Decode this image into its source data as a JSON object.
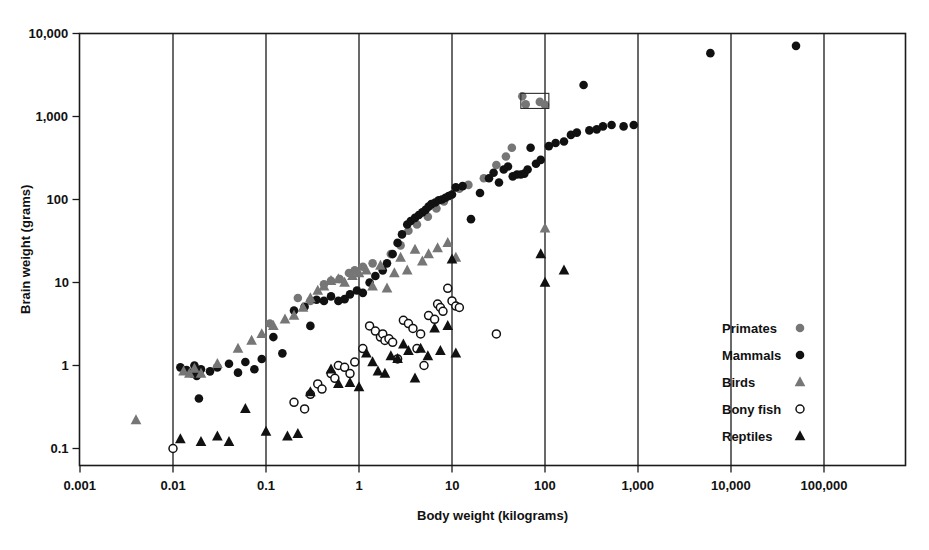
{
  "chart_data": {
    "type": "scatter",
    "title": "",
    "xlabel": "Body weight (kilograms)",
    "ylabel": "Brain weight (grams)",
    "xscale": "log",
    "yscale": "log",
    "xlim": [
      0.001,
      1000000
    ],
    "ylim": [
      0.07,
      10000
    ],
    "xticks": [
      0.001,
      0.01,
      0.1,
      1,
      10,
      100,
      1000,
      10000,
      100000
    ],
    "xticklabels": [
      "0.001",
      "0.01",
      "0.1",
      "1",
      "10",
      "100",
      "1,000",
      "10,000",
      "100,000"
    ],
    "yticks": [
      0.1,
      1,
      10,
      100,
      1000,
      10000
    ],
    "yticklabels": [
      "0.1",
      "1",
      "10",
      "100",
      "1,000",
      "10,000"
    ],
    "grid": "vertical-decade-lines",
    "legend_position": "inside-lower-right",
    "annotations": [
      {
        "kind": "box",
        "label": "",
        "x0": 55,
        "x1": 110,
        "y0": 1250,
        "y1": 1900
      }
    ],
    "series": [
      {
        "name": "Primates",
        "marker": "filled-circle",
        "color": "#767676",
        "points": [
          [
            0.11,
            3.2
          ],
          [
            0.22,
            6.5
          ],
          [
            0.3,
            6.0
          ],
          [
            0.42,
            9.5
          ],
          [
            0.5,
            10.5
          ],
          [
            0.62,
            11.0
          ],
          [
            0.78,
            13.0
          ],
          [
            0.9,
            14.0
          ],
          [
            1.1,
            15.5
          ],
          [
            1.4,
            17.0
          ],
          [
            2.2,
            22.0
          ],
          [
            2.8,
            28.0
          ],
          [
            3.4,
            42.0
          ],
          [
            4.2,
            50.0
          ],
          [
            5.5,
            62.0
          ],
          [
            6.8,
            78.0
          ],
          [
            8.2,
            95.0
          ],
          [
            9.5,
            110.0
          ],
          [
            12.0,
            135.0
          ],
          [
            15.0,
            150.0
          ],
          [
            22.0,
            180.0
          ],
          [
            30.0,
            260.0
          ],
          [
            38.0,
            330.0
          ],
          [
            44.0,
            420.0
          ],
          [
            57.0,
            1750.0
          ],
          [
            62.0,
            1400.0
          ],
          [
            88.0,
            1500.0
          ],
          [
            100.0,
            1380.0
          ]
        ]
      },
      {
        "name": "Mammals",
        "marker": "filled-circle",
        "color": "#111111",
        "points": [
          [
            0.012,
            0.95
          ],
          [
            0.014,
            0.88
          ],
          [
            0.016,
            0.8
          ],
          [
            0.017,
            1.0
          ],
          [
            0.018,
            0.75
          ],
          [
            0.019,
            0.4
          ],
          [
            0.02,
            0.9
          ],
          [
            0.025,
            0.85
          ],
          [
            0.03,
            0.95
          ],
          [
            0.04,
            1.05
          ],
          [
            0.05,
            0.82
          ],
          [
            0.06,
            1.1
          ],
          [
            0.075,
            0.9
          ],
          [
            0.09,
            1.2
          ],
          [
            0.12,
            2.2
          ],
          [
            0.15,
            1.4
          ],
          [
            0.2,
            4.6
          ],
          [
            0.26,
            5.1
          ],
          [
            0.3,
            3.0
          ],
          [
            0.35,
            6.2
          ],
          [
            0.42,
            6.0
          ],
          [
            0.5,
            6.8
          ],
          [
            0.6,
            6.0
          ],
          [
            0.7,
            6.3
          ],
          [
            0.8,
            7.2
          ],
          [
            0.95,
            8.0
          ],
          [
            1.1,
            7.5
          ],
          [
            1.3,
            10.0
          ],
          [
            1.5,
            12.0
          ],
          [
            1.8,
            14.0
          ],
          [
            2.0,
            17.0
          ],
          [
            2.3,
            22.0
          ],
          [
            2.6,
            30.0
          ],
          [
            2.9,
            38.0
          ],
          [
            3.3,
            50.0
          ],
          [
            3.6,
            55.0
          ],
          [
            4.0,
            60.0
          ],
          [
            4.4,
            65.0
          ],
          [
            4.8,
            70.0
          ],
          [
            5.2,
            75.0
          ],
          [
            5.6,
            82.0
          ],
          [
            6.0,
            88.0
          ],
          [
            6.6,
            92.0
          ],
          [
            7.2,
            98.0
          ],
          [
            7.8,
            100.0
          ],
          [
            8.5,
            105.0
          ],
          [
            9.2,
            110.0
          ],
          [
            10.0,
            115.0
          ],
          [
            11.0,
            140.0
          ],
          [
            13.0,
            145.0
          ],
          [
            16.0,
            58.0
          ],
          [
            20.0,
            120.0
          ],
          [
            25.0,
            180.0
          ],
          [
            28.0,
            210.0
          ],
          [
            32.0,
            160.0
          ],
          [
            36.0,
            230.0
          ],
          [
            40.0,
            250.0
          ],
          [
            45.0,
            190.0
          ],
          [
            50.0,
            200.0
          ],
          [
            55.0,
            200.0
          ],
          [
            60.0,
            205.0
          ],
          [
            65.0,
            230.0
          ],
          [
            70.0,
            420.0
          ],
          [
            80.0,
            270.0
          ],
          [
            90.0,
            300.0
          ],
          [
            110.0,
            440.0
          ],
          [
            130.0,
            480.0
          ],
          [
            160.0,
            500.0
          ],
          [
            190.0,
            600.0
          ],
          [
            220.0,
            640.0
          ],
          [
            260.0,
            2400.0
          ],
          [
            300.0,
            680.0
          ],
          [
            360.0,
            700.0
          ],
          [
            420.0,
            760.0
          ],
          [
            520.0,
            790.0
          ],
          [
            700.0,
            760.0
          ],
          [
            900.0,
            790.0
          ],
          [
            6000.0,
            5800.0
          ],
          [
            50000.0,
            7100.0
          ]
        ]
      },
      {
        "name": "Birds",
        "marker": "filled-triangle",
        "color": "#767676",
        "points": [
          [
            0.004,
            0.22
          ],
          [
            0.013,
            0.85
          ],
          [
            0.015,
            0.8
          ],
          [
            0.017,
            0.92
          ],
          [
            0.02,
            0.8
          ],
          [
            0.03,
            1.05
          ],
          [
            0.05,
            1.6
          ],
          [
            0.07,
            2.0
          ],
          [
            0.09,
            2.4
          ],
          [
            0.12,
            3.0
          ],
          [
            0.16,
            3.6
          ],
          [
            0.2,
            4.0
          ],
          [
            0.25,
            5.0
          ],
          [
            0.3,
            6.5
          ],
          [
            0.36,
            8.0
          ],
          [
            0.42,
            9.0
          ],
          [
            0.5,
            10.5
          ],
          [
            0.6,
            11.0
          ],
          [
            0.7,
            10.0
          ],
          [
            0.85,
            12.0
          ],
          [
            1.0,
            13.0
          ],
          [
            1.2,
            14.0
          ],
          [
            1.4,
            9.0
          ],
          [
            1.7,
            16.0
          ],
          [
            2.0,
            8.5
          ],
          [
            2.4,
            13.0
          ],
          [
            2.8,
            20.0
          ],
          [
            3.3,
            14.0
          ],
          [
            4.0,
            25.0
          ],
          [
            4.8,
            18.0
          ],
          [
            5.6,
            22.0
          ],
          [
            7.0,
            26.0
          ],
          [
            9.0,
            30.0
          ],
          [
            11.0,
            20.0
          ],
          [
            100.0,
            45.0
          ]
        ]
      },
      {
        "name": "Bony fish",
        "marker": "open-circle",
        "color": "#111111",
        "points": [
          [
            0.01,
            0.1
          ],
          [
            0.2,
            0.36
          ],
          [
            0.26,
            0.3
          ],
          [
            0.3,
            0.45
          ],
          [
            0.36,
            0.6
          ],
          [
            0.4,
            0.52
          ],
          [
            0.5,
            0.8
          ],
          [
            0.55,
            0.7
          ],
          [
            0.6,
            1.0
          ],
          [
            0.7,
            0.95
          ],
          [
            0.8,
            0.8
          ],
          [
            0.9,
            1.1
          ],
          [
            1.1,
            1.6
          ],
          [
            1.3,
            3.0
          ],
          [
            1.5,
            2.6
          ],
          [
            1.7,
            2.2
          ],
          [
            1.8,
            2.4
          ],
          [
            1.9,
            2.0
          ],
          [
            2.1,
            2.1
          ],
          [
            2.3,
            1.9
          ],
          [
            2.6,
            1.2
          ],
          [
            3.0,
            3.5
          ],
          [
            3.4,
            3.2
          ],
          [
            3.8,
            2.8
          ],
          [
            4.2,
            1.6
          ],
          [
            4.6,
            2.4
          ],
          [
            5.0,
            1.0
          ],
          [
            5.6,
            4.0
          ],
          [
            6.5,
            3.6
          ],
          [
            7.0,
            5.5
          ],
          [
            7.5,
            5.0
          ],
          [
            8.0,
            4.5
          ],
          [
            9.0,
            8.5
          ],
          [
            10.0,
            6.0
          ],
          [
            11.0,
            5.2
          ],
          [
            12.0,
            5.0
          ],
          [
            30.0,
            2.4
          ]
        ]
      },
      {
        "name": "Reptiles",
        "marker": "filled-triangle",
        "color": "#111111",
        "points": [
          [
            0.012,
            0.13
          ],
          [
            0.02,
            0.12
          ],
          [
            0.03,
            0.14
          ],
          [
            0.04,
            0.12
          ],
          [
            0.06,
            0.3
          ],
          [
            0.1,
            0.16
          ],
          [
            0.17,
            0.14
          ],
          [
            0.22,
            0.15
          ],
          [
            0.3,
            0.48
          ],
          [
            0.5,
            0.9
          ],
          [
            0.6,
            0.6
          ],
          [
            0.8,
            0.62
          ],
          [
            1.0,
            0.55
          ],
          [
            1.2,
            1.4
          ],
          [
            1.4,
            1.1
          ],
          [
            1.6,
            0.85
          ],
          [
            1.9,
            0.8
          ],
          [
            2.2,
            1.3
          ],
          [
            2.6,
            1.2
          ],
          [
            3.0,
            1.8
          ],
          [
            3.4,
            1.5
          ],
          [
            4.0,
            0.7
          ],
          [
            4.6,
            1.6
          ],
          [
            5.5,
            1.3
          ],
          [
            6.5,
            2.8
          ],
          [
            7.5,
            1.5
          ],
          [
            9.0,
            3.0
          ],
          [
            10.0,
            19.0
          ],
          [
            11.0,
            1.4
          ],
          [
            90.0,
            22.0
          ],
          [
            100.0,
            10.0
          ],
          [
            160.0,
            14.0
          ]
        ]
      }
    ]
  },
  "legend": {
    "entries": [
      {
        "label": "Primates",
        "marker": "filled-circle",
        "color": "#767676"
      },
      {
        "label": "Mammals",
        "marker": "filled-circle",
        "color": "#111111"
      },
      {
        "label": "Birds",
        "marker": "filled-triangle",
        "color": "#767676"
      },
      {
        "label": "Bony fish",
        "marker": "open-circle",
        "color": "#111111"
      },
      {
        "label": "Reptiles",
        "marker": "filled-triangle",
        "color": "#111111"
      }
    ]
  }
}
